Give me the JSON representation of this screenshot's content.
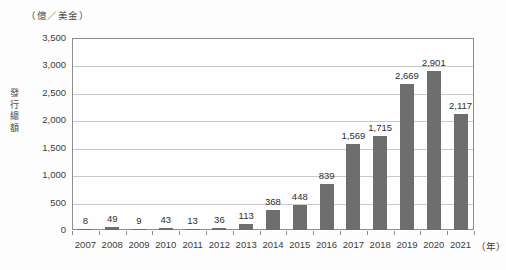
{
  "chart_data": {
    "type": "bar",
    "title": "",
    "subtitle": "",
    "unit_caption": "（億／美金）",
    "xlabel": "（年）",
    "ylabel": "發行總額",
    "categories": [
      "2007",
      "2008",
      "2009",
      "2010",
      "2011",
      "2012",
      "2013",
      "2014",
      "2015",
      "2016",
      "2017",
      "2018",
      "2019",
      "2020",
      "2021"
    ],
    "values": [
      8,
      49,
      9,
      43,
      13,
      36,
      113,
      368,
      448,
      839,
      1569,
      1715,
      2669,
      2901,
      2117
    ],
    "value_labels": [
      "8",
      "49",
      "9",
      "43",
      "13",
      "36",
      "113",
      "368",
      "448",
      "839",
      "1,569",
      "1,715",
      "2,669",
      "2,901",
      "2,117"
    ],
    "ylim": [
      0,
      3500
    ],
    "ytick_values": [
      0,
      500,
      1000,
      1500,
      2000,
      2500,
      3000,
      3500
    ],
    "ytick_labels": [
      "0",
      "500",
      "1,000",
      "1,500",
      "2,000",
      "2,500",
      "3,000",
      "3,500"
    ],
    "grid": true,
    "legend": null,
    "legend_position": "none",
    "series_color": "#6e6e6e",
    "gridline_color": "#c9c9c9",
    "frame_color": "#8d8d8d",
    "background_color": "#fdfdfd"
  }
}
